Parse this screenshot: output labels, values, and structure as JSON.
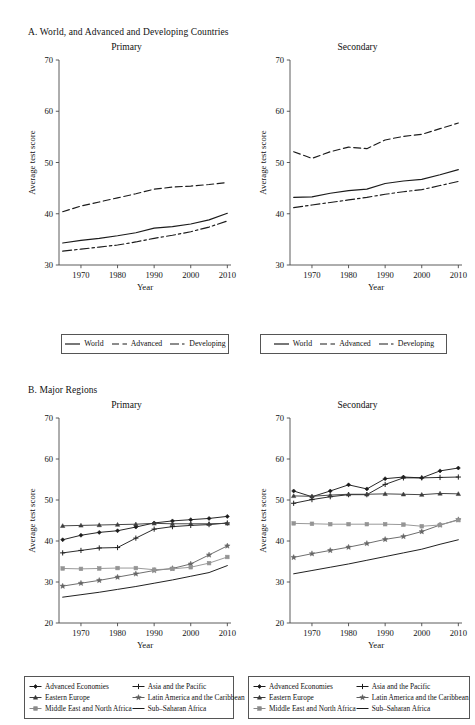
{
  "figure": {
    "panelA_title": "A. World, and Advanced and Developing Countries",
    "panelB_title": "B. Major Regions",
    "subtitle_primary": "Primary",
    "subtitle_secondary": "Secondary",
    "ylabel": "Average test score",
    "xlabel": "Year"
  },
  "legendA": {
    "items": [
      {
        "label": "World",
        "style": "solid"
      },
      {
        "label": "Advanced",
        "style": "dashed"
      },
      {
        "label": "Developing",
        "style": "dashdot"
      }
    ]
  },
  "legendB": {
    "items": [
      {
        "label": "Advanced Economies",
        "marker": "diamond",
        "color": "#1b1b1b"
      },
      {
        "label": "Asia and the Pacific",
        "marker": "plus",
        "color": "#1b1b1b"
      },
      {
        "label": "Eastern Europe",
        "marker": "triangle",
        "color": "#3a3a3a"
      },
      {
        "label": "Latin America and the Caribbean",
        "marker": "star",
        "color": "#5e5e5e"
      },
      {
        "label": "Middle East and North Africa",
        "marker": "square",
        "color": "#8a8a8a"
      },
      {
        "label": "Sub–Saharan Africa",
        "marker": "line",
        "color": "#1b1b1b"
      }
    ]
  },
  "chart_data": [
    {
      "id": "A-primary",
      "type": "line",
      "title": "Primary",
      "xlabel": "Year",
      "ylabel": "Average test score",
      "xlim": [
        1964,
        2011
      ],
      "ylim": [
        30,
        70
      ],
      "xticks": [
        1970,
        1980,
        1990,
        2000,
        2010
      ],
      "yticks": [
        30,
        40,
        50,
        60,
        70
      ],
      "grid": false,
      "legend_position": "below",
      "x": [
        1965,
        1970,
        1975,
        1980,
        1985,
        1990,
        1995,
        2000,
        2005,
        2010
      ],
      "series": [
        {
          "name": "World",
          "style": "solid",
          "values": [
            34.3,
            34.8,
            35.2,
            35.7,
            36.3,
            37.2,
            37.5,
            38.0,
            38.8,
            40.1
          ]
        },
        {
          "name": "Advanced",
          "style": "dashed",
          "values": [
            40.4,
            41.5,
            42.3,
            43.1,
            43.9,
            44.8,
            45.2,
            45.4,
            45.7,
            46.1
          ]
        },
        {
          "name": "Developing",
          "style": "dashdot",
          "values": [
            32.7,
            33.1,
            33.5,
            33.9,
            34.5,
            35.2,
            35.8,
            36.5,
            37.4,
            38.6
          ]
        }
      ]
    },
    {
      "id": "A-secondary",
      "type": "line",
      "title": "Secondary",
      "xlabel": "Year",
      "ylabel": "Average test score",
      "xlim": [
        1964,
        2011
      ],
      "ylim": [
        30,
        70
      ],
      "xticks": [
        1970,
        1980,
        1990,
        2000,
        2010
      ],
      "yticks": [
        30,
        40,
        50,
        60,
        70
      ],
      "grid": false,
      "legend_position": "below",
      "x": [
        1965,
        1970,
        1975,
        1980,
        1985,
        1990,
        1995,
        2000,
        2005,
        2010
      ],
      "series": [
        {
          "name": "World",
          "style": "solid",
          "values": [
            43.2,
            43.3,
            44.0,
            44.5,
            44.8,
            45.9,
            46.4,
            46.7,
            47.6,
            48.6
          ]
        },
        {
          "name": "Advanced",
          "style": "dashed",
          "values": [
            52.1,
            50.8,
            52.1,
            53.0,
            52.7,
            54.4,
            55.1,
            55.5,
            56.6,
            57.7
          ]
        },
        {
          "name": "Developing",
          "style": "dashdot",
          "values": [
            41.2,
            41.7,
            42.2,
            42.7,
            43.2,
            43.8,
            44.3,
            44.7,
            45.5,
            46.3
          ]
        }
      ]
    },
    {
      "id": "B-primary",
      "type": "line",
      "title": "Primary",
      "xlabel": "Year",
      "ylabel": "Average test score",
      "xlim": [
        1964,
        2011
      ],
      "ylim": [
        20,
        70
      ],
      "xticks": [
        1970,
        1980,
        1990,
        2000,
        2010
      ],
      "yticks": [
        20,
        30,
        40,
        50,
        60,
        70
      ],
      "grid": false,
      "legend_position": "below",
      "x": [
        1965,
        1970,
        1975,
        1980,
        1985,
        1990,
        1995,
        2000,
        2005,
        2010
      ],
      "series": [
        {
          "name": "Advanced Economies",
          "marker": "diamond",
          "values": [
            40.3,
            41.4,
            42.1,
            42.5,
            43.4,
            44.4,
            44.9,
            45.2,
            45.5,
            46.0
          ]
        },
        {
          "name": "Asia and the Pacific",
          "marker": "plus",
          "values": [
            37.1,
            37.7,
            38.3,
            38.4,
            40.7,
            42.9,
            43.5,
            43.8,
            44.0,
            44.4
          ]
        },
        {
          "name": "Eastern Europe",
          "marker": "triangle",
          "values": [
            43.7,
            43.8,
            43.9,
            44.0,
            44.1,
            44.3,
            44.2,
            44.2,
            44.2,
            44.3
          ]
        },
        {
          "name": "Latin America and the Caribbean",
          "marker": "star",
          "values": [
            29.0,
            29.7,
            30.4,
            31.2,
            32.0,
            32.8,
            33.3,
            34.4,
            36.6,
            38.8
          ]
        },
        {
          "name": "Middle East and North Africa",
          "marker": "square",
          "values": [
            33.3,
            33.2,
            33.3,
            33.4,
            33.4,
            33.0,
            33.2,
            33.6,
            34.6,
            36.1
          ]
        },
        {
          "name": "Sub–Saharan Africa",
          "marker": "line",
          "values": [
            26.3,
            26.9,
            27.5,
            28.2,
            28.9,
            29.7,
            30.5,
            31.4,
            32.3,
            34.0
          ]
        }
      ]
    },
    {
      "id": "B-secondary",
      "type": "line",
      "title": "Secondary",
      "xlabel": "Year",
      "ylabel": "Average test score",
      "xlim": [
        1964,
        2011
      ],
      "ylim": [
        20,
        70
      ],
      "xticks": [
        1970,
        1980,
        1990,
        2000,
        2010
      ],
      "yticks": [
        20,
        30,
        40,
        50,
        60,
        70
      ],
      "grid": false,
      "legend_position": "below",
      "x": [
        1965,
        1970,
        1975,
        1980,
        1985,
        1990,
        1995,
        2000,
        2005,
        2010
      ],
      "series": [
        {
          "name": "Advanced Economies",
          "marker": "diamond",
          "values": [
            52.2,
            50.8,
            52.2,
            53.7,
            52.7,
            55.2,
            55.6,
            55.4,
            57.1,
            57.8
          ]
        },
        {
          "name": "Asia and the Pacific",
          "marker": "plus",
          "values": [
            49.2,
            50.1,
            50.8,
            51.3,
            51.3,
            53.8,
            55.4,
            55.4,
            55.5,
            55.6
          ]
        },
        {
          "name": "Eastern Europe",
          "marker": "triangle",
          "values": [
            51.0,
            50.9,
            51.2,
            51.4,
            51.4,
            51.5,
            51.4,
            51.3,
            51.6,
            51.5
          ]
        },
        {
          "name": "Latin America and the Caribbean",
          "marker": "star",
          "values": [
            36.0,
            36.9,
            37.7,
            38.5,
            39.4,
            40.4,
            41.1,
            42.3,
            43.9,
            45.2
          ]
        },
        {
          "name": "Middle East and North Africa",
          "marker": "square",
          "values": [
            44.3,
            44.2,
            44.1,
            44.1,
            44.1,
            44.1,
            44.0,
            43.6,
            43.9,
            45.1
          ]
        },
        {
          "name": "Sub–Saharan Africa",
          "marker": "line",
          "values": [
            32.0,
            32.8,
            33.6,
            34.4,
            35.3,
            36.2,
            37.1,
            38.0,
            39.2,
            40.3
          ]
        }
      ]
    }
  ]
}
